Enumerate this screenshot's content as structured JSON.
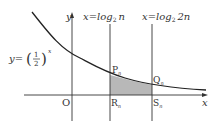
{
  "diagram": {
    "curve_label": {
      "prefix": "y=",
      "base_num": "1",
      "base_den": "2",
      "exponent": "x",
      "lparen": "(",
      "rparen": ")"
    },
    "axes": {
      "x_label": "x",
      "y_label": "y",
      "origin": "O"
    },
    "lines": [
      {
        "label_pre": "x=log",
        "label_sub": "2",
        "label_arg": "n"
      },
      {
        "label_pre": "x=log",
        "label_sub": "2",
        "label_arg": "2n"
      }
    ],
    "points": {
      "P": {
        "letter": "P",
        "sub": "n"
      },
      "Q": {
        "letter": "Q",
        "sub": "n"
      },
      "R": {
        "letter": "R",
        "sub": "n"
      },
      "S": {
        "letter": "S",
        "sub": "n"
      }
    },
    "shade_color": "#b8b8b8",
    "line_color": "#333333"
  }
}
